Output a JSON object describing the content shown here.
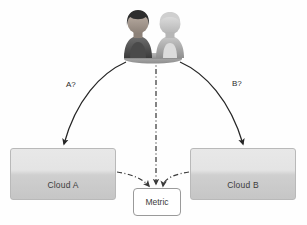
{
  "diagram": {
    "background_color": "#fefefe",
    "nodes": {
      "cloud_a": {
        "label": "Cloud A",
        "fill_top": "#e8e8e8",
        "fill_bottom": "#c6c6c6",
        "border": "#b9b9b9"
      },
      "cloud_b": {
        "label": "Cloud B",
        "fill_top": "#e8e8e8",
        "fill_bottom": "#c6c6c6",
        "border": "#b9b9b9"
      },
      "metric": {
        "label": "Metric",
        "fill": "#ffffff",
        "border": "#9a9a9a"
      },
      "people": {
        "label": "Users",
        "left_person": "woman-avatar",
        "right_person": "man-avatar"
      }
    },
    "edges": {
      "people_to_cloud_a": {
        "label": "A?",
        "style": "solid-curved-arrow",
        "color": "#262626"
      },
      "people_to_cloud_b": {
        "label": "B?",
        "style": "solid-curved-arrow",
        "color": "#262626"
      },
      "people_to_metric": {
        "label": "",
        "style": "dash-dot-arrow",
        "color": "#3a3a3a"
      },
      "cloud_a_to_metric": {
        "label": "",
        "style": "dash-dot-curve",
        "color": "#3a3a3a"
      },
      "cloud_b_to_metric": {
        "label": "",
        "style": "dash-dot-curve",
        "color": "#3a3a3a"
      }
    }
  }
}
